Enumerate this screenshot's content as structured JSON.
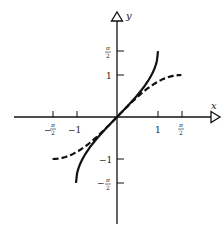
{
  "chart_data": {
    "type": "line",
    "title": "",
    "xlabel": "x",
    "ylabel": "y",
    "xlim": [
      -2.45,
      2.5
    ],
    "ylim": [
      -2.55,
      2.55
    ],
    "grid": false,
    "legend": null,
    "x_ticks": [
      {
        "value": -1.5708,
        "label": "−π/2"
      },
      {
        "value": -1,
        "label": "−1"
      },
      {
        "value": 1,
        "label": "1"
      },
      {
        "value": 1.5708,
        "label": "π/2"
      }
    ],
    "y_ticks": [
      {
        "value": 1.5708,
        "label": "π/2"
      },
      {
        "value": 1,
        "label": "1"
      },
      {
        "value": -1,
        "label": "−1"
      },
      {
        "value": -1.5708,
        "label": "−π/2"
      }
    ],
    "series": [
      {
        "name": "arcsin x",
        "style": "solid",
        "domain": [
          -1,
          1
        ],
        "x": [
          -1,
          -0.95,
          -0.8,
          -0.6,
          -0.4,
          -0.2,
          0,
          0.2,
          0.4,
          0.6,
          0.8,
          0.95,
          1
        ],
        "values": [
          -1.5708,
          -1.2532,
          -0.9273,
          -0.6435,
          -0.4115,
          -0.2014,
          0,
          0.2014,
          0.4115,
          0.6435,
          0.9273,
          1.2532,
          1.5708
        ]
      },
      {
        "name": "sin x",
        "style": "dashed",
        "domain": [
          -1.5708,
          1.5708
        ],
        "x": [
          -1.5708,
          -1.2,
          -0.8,
          -0.4,
          0,
          0.4,
          0.8,
          1.2,
          1.5708
        ],
        "values": [
          -1,
          -0.932,
          -0.7174,
          -0.3894,
          0,
          0.3894,
          0.7174,
          0.932,
          1
        ]
      }
    ]
  },
  "axes": {
    "x_label": "x",
    "y_label": "y"
  },
  "ticks": {
    "x": [
      "−π/2",
      "−1",
      "1",
      "π/2"
    ],
    "y": [
      "π/2",
      "1",
      "−1",
      "−π/2"
    ]
  },
  "style": {
    "ink": "#111111"
  }
}
